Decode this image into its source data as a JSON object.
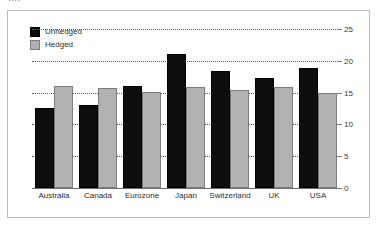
{
  "caption": {
    "clipped_text": "...."
  },
  "legend": {
    "position": "top-left",
    "items": [
      {
        "label": "Unhedged",
        "color": "#0d0d0d",
        "swatch": "unhedged-swatch"
      },
      {
        "label": "Hedged",
        "color": "#b2b2b2",
        "swatch": "hedged-swatch"
      }
    ]
  },
  "chart_data": {
    "type": "bar",
    "title": "",
    "xlabel": "",
    "ylabel": "",
    "ylim": [
      0,
      25
    ],
    "yticks": [
      0,
      5,
      10,
      15,
      20,
      25
    ],
    "ytick_labels": [
      "0",
      "5",
      "10",
      "15",
      "20",
      "25"
    ],
    "grid": true,
    "grid_style": "dotted-horizontal",
    "legend_position": "top-left",
    "categories": [
      "Australia",
      "Canada",
      "Eurozone",
      "Japan",
      "Switzerland",
      "UK",
      "USA"
    ],
    "series": [
      {
        "name": "Unhedged",
        "color": "#0d0d0d",
        "values": [
          12.6,
          13.0,
          16.1,
          21.1,
          18.4,
          17.3,
          18.9
        ]
      },
      {
        "name": "Hedged",
        "color": "#b2b2b2",
        "values": [
          16.1,
          15.7,
          15.1,
          15.9,
          15.4,
          15.9,
          15.0
        ]
      }
    ]
  },
  "colors": {
    "frame": "#bdbdbd",
    "background": "#ffffff",
    "grid": "#5a5a5a",
    "axis": "#6e6e6e",
    "text": "#2d2d2d"
  }
}
